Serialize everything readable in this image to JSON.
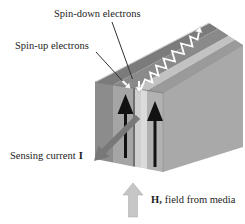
{
  "figure": {
    "type": "physics-diagram"
  },
  "labels": {
    "spin_down_electrons": "Spin-down electrons",
    "spin_up_electrons": "Spin-up electrons",
    "sensing_current": "Sensing current",
    "current_symbol": "I",
    "field_symbol": "H,",
    "field_from_media": "field from media"
  },
  "arrows": {
    "magnetization_left": {
      "direction": "up",
      "color_ref": "magnetization_arrow"
    },
    "magnetization_right": {
      "direction": "up",
      "color_ref": "magnetization_arrow"
    },
    "sensing_current": {
      "direction": "down-left-out-of-film",
      "color_ref": "current_arrow"
    },
    "field_from_media": {
      "direction": "up",
      "color_ref": "field_arrow"
    },
    "spin_up_electron": {
      "direction": "down-right-into-layers",
      "style": "straight",
      "color_ref": "electron_path"
    },
    "spin_down_electron": {
      "direction": "up-right-along-top",
      "style": "zigzag-scattering",
      "color_ref": "electron_path"
    }
  },
  "colors": {
    "background": "#ffffff",
    "front_layer_dark": "#8c8c8c",
    "front_layer_fm1": "#a5a5a5",
    "spacer_edge_line": "#6f6f6f",
    "spacer_light": "#cfcfcf",
    "spacer_lighter": "#dbdbdb",
    "front_layer_fm2": "#b2b2b2",
    "top_dark": "#7b7b7b",
    "top_fm1": "#8a8a8a",
    "top_spacer": "#c2c2c2",
    "top_fm2": "#9a9a9a",
    "side_face": "#a9a9a9",
    "magnetization_arrow": "#121212",
    "current_arrow": "#787878",
    "field_arrow": "#c6c6c6",
    "electron_path": "#ffffff",
    "pointer_line": "#333333",
    "text": "#1c1c1c"
  }
}
